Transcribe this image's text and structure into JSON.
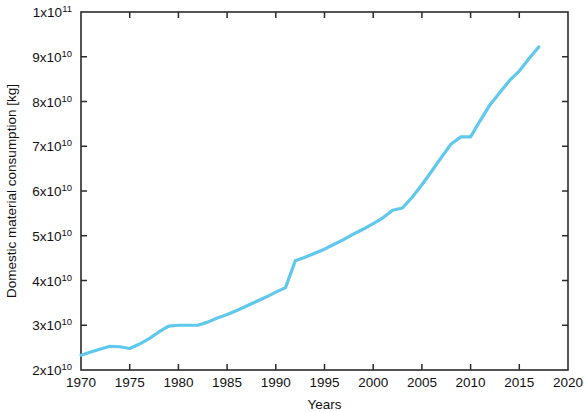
{
  "chart_data": {
    "type": "line",
    "title": "",
    "xlabel": "Years",
    "ylabel": "Domestic material consumption  [kg]",
    "xlim": [
      1970,
      2020
    ],
    "ylim": [
      20000000000,
      100000000000
    ],
    "grid": false,
    "legend": null,
    "x_ticks": [
      1970,
      1975,
      1980,
      1985,
      1990,
      1995,
      2000,
      2005,
      2010,
      2015,
      2020
    ],
    "x_tick_labels": [
      "1970",
      "1975",
      "1980",
      "1985",
      "1990",
      "1995",
      "2000",
      "2005",
      "2010",
      "2015",
      "2020"
    ],
    "y_ticks": [
      20000000000,
      30000000000,
      40000000000,
      50000000000,
      60000000000,
      70000000000,
      80000000000,
      90000000000,
      100000000000
    ],
    "y_tick_labels": [
      {
        "mantissa": "2x10",
        "exponent": "10"
      },
      {
        "mantissa": "3x10",
        "exponent": "10"
      },
      {
        "mantissa": "4x10",
        "exponent": "10"
      },
      {
        "mantissa": "5x10",
        "exponent": "10"
      },
      {
        "mantissa": "6x10",
        "exponent": "10"
      },
      {
        "mantissa": "7x10",
        "exponent": "10"
      },
      {
        "mantissa": "8x10",
        "exponent": "10"
      },
      {
        "mantissa": "9x10",
        "exponent": "10"
      },
      {
        "mantissa": "1x10",
        "exponent": "11"
      }
    ],
    "line_color": "#5FC8EC",
    "line_width": 3.2,
    "series": [
      {
        "name": "Domestic material consumption",
        "x": [
          1970,
          1971,
          1972,
          1973,
          1974,
          1975,
          1976,
          1977,
          1978,
          1979,
          1980,
          1981,
          1982,
          1983,
          1984,
          1985,
          1986,
          1987,
          1988,
          1989,
          1990,
          1991,
          1992,
          1993,
          1994,
          1995,
          1996,
          1997,
          1998,
          1999,
          2000,
          2001,
          2002,
          2003,
          2004,
          2005,
          2006,
          2007,
          2008,
          2009,
          2010,
          2011,
          2012,
          2013,
          2014,
          2015,
          2016,
          2017
        ],
        "values": [
          23300000000,
          24000000000,
          24700000000,
          25300000000,
          25200000000,
          24800000000,
          25800000000,
          27000000000,
          28500000000,
          29800000000,
          30000000000,
          30000000000,
          30000000000,
          30700000000,
          31600000000,
          32400000000,
          33300000000,
          34300000000,
          35300000000,
          36300000000,
          37400000000,
          38400000000,
          44400000000,
          45200000000,
          46100000000,
          47000000000,
          48100000000,
          49200000000,
          50400000000,
          51500000000,
          52700000000,
          54000000000,
          55700000000,
          56200000000,
          58600000000,
          61400000000,
          64400000000,
          67500000000,
          70500000000,
          72100000000,
          72100000000,
          75800000000,
          79300000000,
          82000000000,
          84700000000,
          86800000000,
          89600000000,
          92200000000
        ]
      }
    ]
  },
  "plot_box": {
    "left": 81,
    "top": 12,
    "right": 568,
    "bottom": 370
  }
}
